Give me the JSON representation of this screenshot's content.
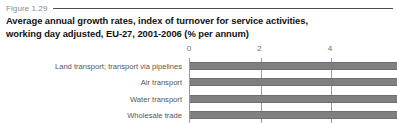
{
  "figure": {
    "label": "Figure 1.29",
    "title_line_1": "Average annual growth rates, index of turnover for service activities,",
    "title_line_2": "working day adjusted, EU-27, 2001-2006 (% per annum)"
  },
  "colors": {
    "bar_fill": "#808080",
    "bar_edge": "#6e6e6e",
    "gridline": "#9a9a9a",
    "label_text": "#555555",
    "tick_text": "#6f6f6f",
    "figure_label_text": "#8a8a8a",
    "title_text": "#111111",
    "background": "#ffffff"
  },
  "chart_data": {
    "type": "bar",
    "orientation": "horizontal",
    "title": "Average annual growth rates, index of turnover for service activities, working day adjusted, EU-27, 2001-2006 (% per annum)",
    "xlabel": "",
    "ylabel": "",
    "unit": "% per annum",
    "categories": [
      "Land transport; transport via pipelines",
      "Air transport",
      "Water transport",
      "Wholesale trade"
    ],
    "values": [
      5.9,
      5.9,
      5.9,
      5.9
    ],
    "values_truncated": true,
    "tick_values": [
      0,
      2,
      4
    ],
    "tick_labels": [
      "0",
      "2",
      "4"
    ],
    "xlim": [
      0,
      5.9
    ],
    "grid": true,
    "grid_axis": "x",
    "legend": false
  }
}
